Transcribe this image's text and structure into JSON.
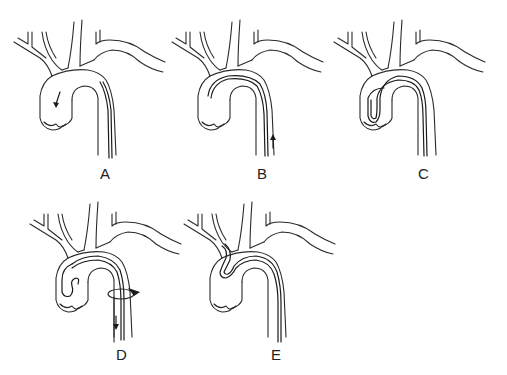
{
  "figure": {
    "panels": [
      {
        "label": "A",
        "state": "wire advanced into ascending aorta, arrow pointing down",
        "label_pos": [
          100,
          165
        ]
      },
      {
        "label": "B",
        "state": "wire looped in ascending aorta, catheter advanced (arrow up)",
        "label_pos": [
          257,
          165
        ]
      },
      {
        "label": "C",
        "state": "catheter and wire formed loop in aortic root",
        "label_pos": [
          418,
          165
        ]
      },
      {
        "label": "D",
        "state": "catheter loop formed, wire withdrawn with ring marker, arrow down",
        "label_pos": [
          116,
          346
        ]
      },
      {
        "label": "E",
        "state": "catheter tip engaged into brachiocephalic branch",
        "label_pos": [
          271,
          346
        ]
      }
    ]
  },
  "colors": {
    "line": "#2a2a2a",
    "background": "#ffffff"
  }
}
